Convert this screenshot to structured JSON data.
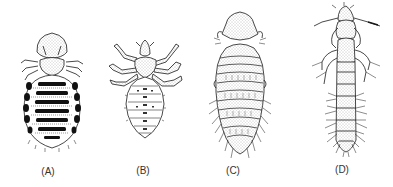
{
  "figure": {
    "panels": [
      {
        "id": "A",
        "label": "(A)",
        "x": 48,
        "y": 167
      },
      {
        "id": "B",
        "label": "(B)",
        "x": 143,
        "y": 166
      },
      {
        "id": "C",
        "label": "(C)",
        "x": 233,
        "y": 166
      },
      {
        "id": "D",
        "label": "(D)",
        "x": 342,
        "y": 165
      }
    ],
    "colors": {
      "ink": "#1a1a1a",
      "stipple": "#8a8a8a",
      "background": "#ffffff"
    }
  }
}
